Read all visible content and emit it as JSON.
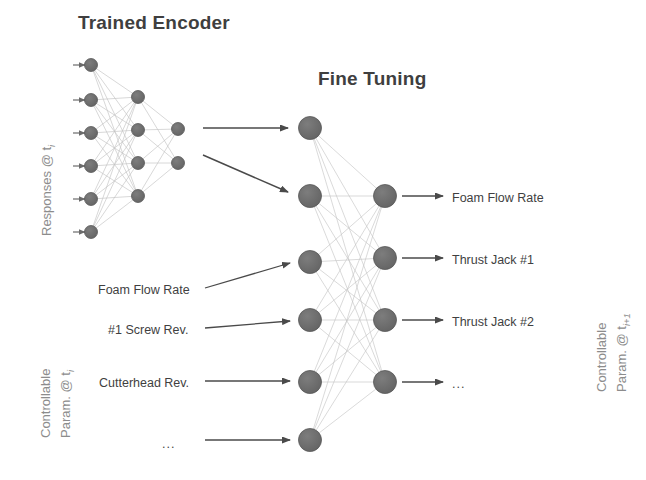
{
  "figure": {
    "background_color": "#ffffff",
    "node_color": "#6b6b6b",
    "node_edge_color": "#585858",
    "link_color": "#c4c4c4",
    "arrow_color": "#4a4a4a",
    "title_color": "#3f3f3f",
    "axis_label_color": "#8c8c8c"
  },
  "titles": {
    "encoder": "Trained Encoder",
    "fine_tuning": "Fine Tuning"
  },
  "side_labels": {
    "left_top": "Responses @ t",
    "left_top_sub": "i",
    "left_bottom_line1": "Controllable",
    "left_bottom_line2": "Param. @ t",
    "left_bottom_sub": "i",
    "right_line1": "Controllable",
    "right_line2": "Param. @ t",
    "right_sub": "i+1"
  },
  "encoder_network": {
    "layer_sizes": [
      6,
      4,
      2
    ],
    "input_marker": "arrow-in",
    "nodes": {
      "input": [
        {
          "x": 91,
          "y": 65
        },
        {
          "x": 91,
          "y": 100
        },
        {
          "x": 91,
          "y": 133
        },
        {
          "x": 91,
          "y": 166
        },
        {
          "x": 91,
          "y": 199
        },
        {
          "x": 91,
          "y": 232
        }
      ],
      "hidden": [
        {
          "x": 138,
          "y": 97
        },
        {
          "x": 138,
          "y": 130
        },
        {
          "x": 138,
          "y": 163
        },
        {
          "x": 138,
          "y": 196
        }
      ],
      "output": [
        {
          "x": 178,
          "y": 129
        },
        {
          "x": 178,
          "y": 163
        }
      ]
    }
  },
  "fine_tuning_network": {
    "layer_sizes": [
      6,
      4
    ],
    "nodes": {
      "input": [
        {
          "x": 310,
          "y": 128
        },
        {
          "x": 310,
          "y": 196
        },
        {
          "x": 310,
          "y": 262
        },
        {
          "x": 310,
          "y": 320
        },
        {
          "x": 310,
          "y": 382
        },
        {
          "x": 310,
          "y": 440
        }
      ],
      "output": [
        {
          "x": 385,
          "y": 196
        },
        {
          "x": 385,
          "y": 258
        },
        {
          "x": 385,
          "y": 320
        },
        {
          "x": 385,
          "y": 382
        }
      ]
    }
  },
  "transfer_arrows": [
    {
      "label": "encoder-to-finetune-arrow-1",
      "x1": 203,
      "y1": 128,
      "x2": 288,
      "y2": 128
    },
    {
      "label": "encoder-to-finetune-arrow-2",
      "x1": 203,
      "y1": 155,
      "x2": 288,
      "y2": 192
    }
  ],
  "input_feature_labels": [
    {
      "text": "Foam Flow Rate",
      "x": 98,
      "y": 283,
      "arrow": {
        "x1": 205,
        "y1": 288,
        "x2": 290,
        "y2": 263
      }
    },
    {
      "text": "#1 Screw Rev.",
      "x": 108,
      "y": 323,
      "arrow": {
        "x1": 205,
        "y1": 328,
        "x2": 290,
        "y2": 321
      }
    },
    {
      "text": "Cutterhead Rev.",
      "x": 99,
      "y": 376,
      "arrow": {
        "x1": 205,
        "y1": 381,
        "x2": 290,
        "y2": 381
      }
    },
    {
      "text": "...",
      "x": 162,
      "y": 437,
      "arrow": {
        "x1": 205,
        "y1": 440,
        "x2": 290,
        "y2": 440
      }
    }
  ],
  "output_feature_labels": [
    {
      "text": "Foam Flow Rate",
      "x": 452,
      "y": 191,
      "arrow": {
        "x1": 402,
        "y1": 196,
        "x2": 443,
        "y2": 196
      }
    },
    {
      "text": "Thrust Jack #1",
      "x": 452,
      "y": 253,
      "arrow": {
        "x1": 402,
        "y1": 258,
        "x2": 443,
        "y2": 258
      }
    },
    {
      "text": "Thrust Jack #2",
      "x": 452,
      "y": 315,
      "arrow": {
        "x1": 402,
        "y1": 320,
        "x2": 443,
        "y2": 320
      }
    },
    {
      "text": "...",
      "x": 452,
      "y": 377,
      "arrow": {
        "x1": 402,
        "y1": 382,
        "x2": 443,
        "y2": 382
      }
    }
  ]
}
